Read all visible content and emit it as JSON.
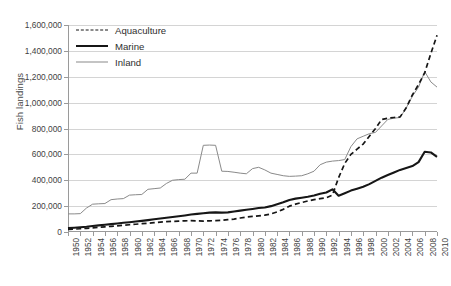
{
  "chart_data": {
    "type": "line",
    "title": "",
    "xlabel": "",
    "ylabel": "Fish landings",
    "ylim": [
      0,
      1600000
    ],
    "xlim": [
      1950,
      2010
    ],
    "grid": true,
    "legend_position": "top-left",
    "ytick_labels": [
      "0",
      "200,000",
      "400,000",
      "600,000",
      "800,000",
      "1,000,000",
      "1,200,000",
      "1,400,000",
      "1,600,000"
    ],
    "ytick_values": [
      0,
      200000,
      400000,
      600000,
      800000,
      1000000,
      1200000,
      1400000,
      1600000
    ],
    "xtick_labels": [
      "1950",
      "1952",
      "1954",
      "1956",
      "1958",
      "1960",
      "1962",
      "1964",
      "1966",
      "1968",
      "1970",
      "1972",
      "1974",
      "1976",
      "1978",
      "1980",
      "1982",
      "1984",
      "1986",
      "1988",
      "1990",
      "1992",
      "1994",
      "1996",
      "1998",
      "2000",
      "2002",
      "2004",
      "2006",
      "2008",
      "2010"
    ],
    "xtick_values": [
      1950,
      1952,
      1954,
      1956,
      1958,
      1960,
      1962,
      1964,
      1966,
      1968,
      1970,
      1972,
      1974,
      1976,
      1978,
      1980,
      1982,
      1984,
      1986,
      1988,
      1990,
      1992,
      1994,
      1996,
      1998,
      2000,
      2002,
      2004,
      2006,
      2008,
      2010
    ],
    "x": [
      1950,
      1951,
      1952,
      1953,
      1954,
      1955,
      1956,
      1957,
      1958,
      1959,
      1960,
      1961,
      1962,
      1963,
      1964,
      1965,
      1966,
      1967,
      1968,
      1969,
      1970,
      1971,
      1972,
      1973,
      1974,
      1975,
      1976,
      1977,
      1978,
      1979,
      1980,
      1981,
      1982,
      1983,
      1984,
      1985,
      1986,
      1987,
      1988,
      1989,
      1990,
      1991,
      1992,
      1993,
      1994,
      1995,
      1996,
      1997,
      1998,
      1999,
      2000,
      2001,
      2002,
      2003,
      2004,
      2005,
      2006,
      2007,
      2008,
      2009,
      2010
    ],
    "series": [
      {
        "name": "Aquaculture",
        "style": "dashed",
        "color": "#161616",
        "values": [
          20000,
          22000,
          25000,
          28000,
          32000,
          36000,
          40000,
          44000,
          48000,
          52000,
          56000,
          60000,
          64000,
          68000,
          72000,
          76000,
          80000,
          82000,
          84000,
          86000,
          88000,
          86000,
          84000,
          86000,
          88000,
          90000,
          95000,
          100000,
          108000,
          115000,
          120000,
          125000,
          130000,
          140000,
          155000,
          175000,
          200000,
          215000,
          228000,
          240000,
          250000,
          258000,
          265000,
          285000,
          420000,
          530000,
          600000,
          640000,
          680000,
          740000,
          800000,
          870000,
          880000,
          885000,
          890000,
          960000,
          1060000,
          1140000,
          1230000,
          1380000,
          1520000
        ]
      },
      {
        "name": "Marine",
        "style": "solid-thick",
        "color": "#161616",
        "values": [
          30000,
          33000,
          37000,
          41000,
          46000,
          51000,
          56000,
          61000,
          66000,
          71000,
          76000,
          81000,
          86000,
          92000,
          98000,
          104000,
          110000,
          116000,
          122000,
          128000,
          135000,
          140000,
          145000,
          150000,
          152000,
          150000,
          152000,
          158000,
          165000,
          172000,
          178000,
          185000,
          190000,
          200000,
          215000,
          230000,
          248000,
          258000,
          265000,
          272000,
          282000,
          295000,
          305000,
          330000,
          280000,
          300000,
          320000,
          335000,
          350000,
          370000,
          395000,
          420000,
          440000,
          460000,
          480000,
          495000,
          510000,
          540000,
          620000,
          615000,
          580000
        ]
      },
      {
        "name": "Inland",
        "style": "solid-thin",
        "color": "#8a8a8a",
        "values": [
          140000,
          140000,
          142000,
          185000,
          215000,
          218000,
          220000,
          250000,
          255000,
          258000,
          285000,
          288000,
          290000,
          330000,
          335000,
          340000,
          375000,
          400000,
          405000,
          408000,
          455000,
          455000,
          670000,
          672000,
          670000,
          470000,
          468000,
          462000,
          455000,
          450000,
          490000,
          500000,
          480000,
          455000,
          445000,
          435000,
          430000,
          432000,
          435000,
          450000,
          470000,
          520000,
          540000,
          548000,
          552000,
          560000,
          660000,
          720000,
          740000,
          760000,
          770000,
          820000,
          870000,
          880000,
          885000,
          960000,
          1050000,
          1120000,
          1240000,
          1160000,
          1120000
        ]
      }
    ]
  },
  "legend": {
    "items": [
      {
        "label": "Aquaculture"
      },
      {
        "label": "Marine"
      },
      {
        "label": "Inland"
      }
    ]
  }
}
